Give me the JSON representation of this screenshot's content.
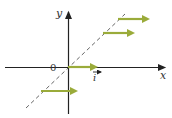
{
  "diagram": {
    "labels": {
      "y_axis": "y",
      "x_axis": "x",
      "origin": "0",
      "unit_vector": "i"
    },
    "colors": {
      "axis": "#222222",
      "dashed_line": "#555555",
      "arrow": "#9aab3a"
    },
    "vectors": [
      {
        "from": [
          118,
          19
        ],
        "to": [
          152,
          19
        ]
      },
      {
        "from": [
          103,
          33
        ],
        "to": [
          137,
          33
        ]
      },
      {
        "from": [
          68,
          67
        ],
        "to": [
          100,
          67
        ]
      },
      {
        "from": [
          41,
          91
        ],
        "to": [
          80,
          91
        ]
      }
    ]
  }
}
